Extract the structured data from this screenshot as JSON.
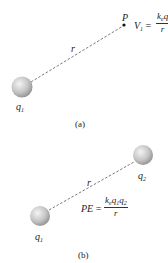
{
  "figure_a": {
    "charge_label": "q",
    "charge_sub": "1",
    "point_label": "P",
    "distance_label": "r",
    "equation_lhs": "V",
    "equation_lhs_sub": "1",
    "equals": "=",
    "numerator_k": "k",
    "numerator_k_sub": "e",
    "numerator_q": "q",
    "denominator": "r",
    "caption": "(a)"
  },
  "figure_b": {
    "charge1_label": "q",
    "charge1_sub": "1",
    "charge2_label": "q",
    "charge2_sub": "2",
    "distance_label": "r",
    "equation_lhs": "PE",
    "equals": "=",
    "numerator_k": "k",
    "numerator_k_sub": "e",
    "numerator_q1": "q",
    "numerator_q1_sub": "1",
    "numerator_q2": "q",
    "numerator_q2_sub": "2",
    "denominator": "r",
    "caption": "(b)"
  },
  "colors": {
    "sphere_light": "#f2f2f2",
    "sphere_dark": "#9a9a9a",
    "line": "#555555"
  }
}
